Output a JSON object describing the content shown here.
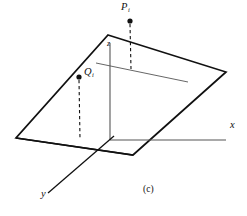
{
  "figure": {
    "caption": "(c)",
    "background_color": "#ffffff",
    "stroke_color": "#111111",
    "line_color_thin": "#555555",
    "points": [
      {
        "id": "P",
        "label_base": "P",
        "label_subscript": "i",
        "dot_x": 130,
        "dot_y": 21,
        "dashed_to_x": 131,
        "dashed_to_y": 69
      },
      {
        "id": "Q",
        "label_base": "Q",
        "label_subscript": "i",
        "dot_x": 79,
        "dot_y": 77,
        "dashed_to_x": 80,
        "dashed_to_y": 139
      }
    ],
    "axes": [
      {
        "id": "x",
        "label": "x",
        "from_x": 110,
        "from_y": 140,
        "to_x": 226,
        "to_y": 140
      },
      {
        "id": "y",
        "label": "y",
        "from_x": 110,
        "from_y": 140,
        "to_x": 48,
        "to_y": 193
      },
      {
        "id": "z",
        "label": "z",
        "from_x": 110,
        "from_y": 140,
        "to_x": 110,
        "to_y": 43
      }
    ],
    "plane": {
      "name": "parallelogram-plane",
      "vertices": "108,35 226,72 133,155 16,138"
    },
    "inner_line": {
      "name": "plane-chord-line",
      "from_x": 96,
      "from_y": 63,
      "to_x": 188,
      "to_y": 82
    }
  }
}
